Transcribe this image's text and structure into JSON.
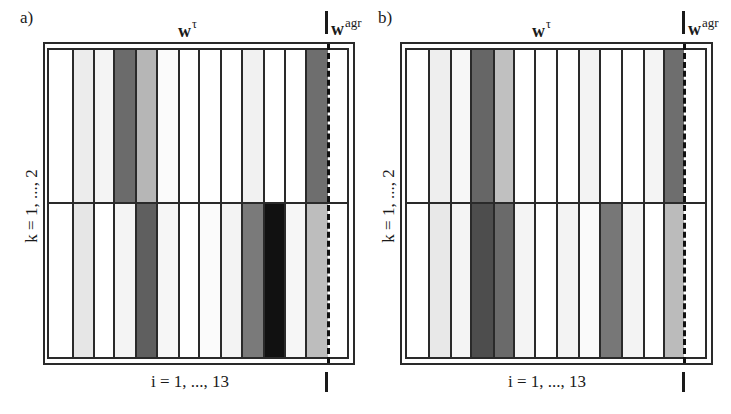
{
  "figure": {
    "panels": [
      {
        "id": "a",
        "label": "a)",
        "top_label_base": "w",
        "top_label_sup": "τ",
        "agr_label_base": "w",
        "agr_label_sup": "agr",
        "x_label": "i = 1, ..., 13",
        "y_label": "k = 1, ..., 2"
      },
      {
        "id": "b",
        "label": "b)",
        "top_label_base": "w",
        "top_label_sup": "τ",
        "agr_label_base": "w",
        "agr_label_sup": "agr",
        "x_label": "i = 1, ..., 13",
        "y_label": "k = 1, ..., 2"
      }
    ]
  },
  "chart_data": [
    {
      "type": "heatmap",
      "title": "a)",
      "xlabel": "i = 1, ..., 13",
      "ylabel": "k = 1, ..., 2",
      "column_header": "w^τ",
      "agr_column_header": "w^agr",
      "columns": [
        "1",
        "2",
        "3",
        "4",
        "5",
        "6",
        "7",
        "8",
        "9",
        "10",
        "11",
        "12",
        "13",
        "agr"
      ],
      "rows": [
        "k=1",
        "k=2"
      ],
      "shades": [
        [
          "#ffffff",
          "#ececec",
          "#f4f4f4",
          "#6b6b6b",
          "#b6b6b6",
          "#fbfbfb",
          "#ffffff",
          "#ffffff",
          "#ffffff",
          "#f1f1f1",
          "#ffffff",
          "#ffffff",
          "#6e6e6e",
          "#ffffff"
        ],
        [
          "#ffffff",
          "#e6e6e6",
          "#ffffff",
          "#f4f4f4",
          "#5f5f5f",
          "#f6f6f6",
          "#ffffff",
          "#fbfbfb",
          "#f3f3f3",
          "#7a7a7a",
          "#111111",
          "#f6f6f6",
          "#bdbdbd",
          "#ffffff"
        ]
      ],
      "grid": true,
      "dashed_separator_before_column": "agr"
    },
    {
      "type": "heatmap",
      "title": "b)",
      "xlabel": "i = 1, ..., 13",
      "ylabel": "k = 1, ..., 2",
      "column_header": "w^τ",
      "agr_column_header": "w^agr",
      "columns": [
        "1",
        "2",
        "3",
        "4",
        "5",
        "6",
        "7",
        "8",
        "9",
        "10",
        "11",
        "12",
        "13",
        "agr"
      ],
      "rows": [
        "k=1",
        "k=2"
      ],
      "shades": [
        [
          "#ffffff",
          "#eeeeee",
          "#f7f7f7",
          "#666666",
          "#c0c0c0",
          "#ffffff",
          "#ffffff",
          "#ffffff",
          "#f3f3f3",
          "#ffffff",
          "#ffffff",
          "#f4f4f4",
          "#6e6e6e",
          "#ffffff"
        ],
        [
          "#ffffff",
          "#e8e8e8",
          "#f4f4f4",
          "#4d4d4d",
          "#6a6a6a",
          "#f4f4f4",
          "#ffffff",
          "#f3f3f3",
          "#fafafa",
          "#777777",
          "#f3f3f3",
          "#ffffff",
          "#bbbbbb",
          "#ffffff"
        ]
      ],
      "grid": true,
      "dashed_separator_before_column": "agr"
    }
  ]
}
